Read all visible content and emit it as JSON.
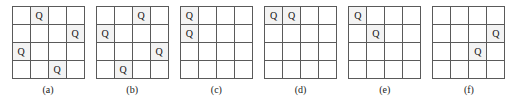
{
  "figure": {
    "rows": 4,
    "cols": 4,
    "queen_glyph": "Q",
    "empty_glyph": "",
    "line_color": "#5a5a5a",
    "text_color": "#111111",
    "background_color": "#ffffff",
    "boards": [
      {
        "caption": "(a)",
        "queens": [
          {
            "row": 0,
            "col": 1
          },
          {
            "row": 1,
            "col": 3
          },
          {
            "row": 2,
            "col": 0
          },
          {
            "row": 3,
            "col": 2
          }
        ],
        "cells": [
          [
            "",
            "Q",
            "",
            ""
          ],
          [
            "",
            "",
            "",
            "Q"
          ],
          [
            "Q",
            "",
            "",
            ""
          ],
          [
            "",
            "",
            "Q",
            ""
          ]
        ]
      },
      {
        "caption": "(b)",
        "queens": [
          {
            "row": 0,
            "col": 2
          },
          {
            "row": 1,
            "col": 0
          },
          {
            "row": 2,
            "col": 3
          },
          {
            "row": 3,
            "col": 1
          }
        ],
        "cells": [
          [
            "",
            "",
            "Q",
            ""
          ],
          [
            "Q",
            "",
            "",
            ""
          ],
          [
            "",
            "",
            "",
            "Q"
          ],
          [
            "",
            "Q",
            "",
            ""
          ]
        ]
      },
      {
        "caption": "(c)",
        "queens": [
          {
            "row": 0,
            "col": 0
          },
          {
            "row": 1,
            "col": 0
          }
        ],
        "cells": [
          [
            "Q",
            "",
            "",
            ""
          ],
          [
            "Q",
            "",
            "",
            ""
          ],
          [
            "",
            "",
            "",
            ""
          ],
          [
            "",
            "",
            "",
            ""
          ]
        ]
      },
      {
        "caption": "(d)",
        "queens": [
          {
            "row": 0,
            "col": 0
          },
          {
            "row": 0,
            "col": 1
          }
        ],
        "cells": [
          [
            "Q",
            "Q",
            "",
            ""
          ],
          [
            "",
            "",
            "",
            ""
          ],
          [
            "",
            "",
            "",
            ""
          ],
          [
            "",
            "",
            "",
            ""
          ]
        ]
      },
      {
        "caption": "(e)",
        "queens": [
          {
            "row": 0,
            "col": 0
          },
          {
            "row": 1,
            "col": 1
          }
        ],
        "cells": [
          [
            "Q",
            "",
            "",
            ""
          ],
          [
            "",
            "Q",
            "",
            ""
          ],
          [
            "",
            "",
            "",
            ""
          ],
          [
            "",
            "",
            "",
            ""
          ]
        ]
      },
      {
        "caption": "(f)",
        "queens": [
          {
            "row": 1,
            "col": 3
          },
          {
            "row": 2,
            "col": 2
          }
        ],
        "cells": [
          [
            "",
            "",
            "",
            ""
          ],
          [
            "",
            "",
            "",
            "Q"
          ],
          [
            "",
            "",
            "Q",
            ""
          ],
          [
            "",
            "",
            "",
            ""
          ]
        ]
      }
    ]
  }
}
